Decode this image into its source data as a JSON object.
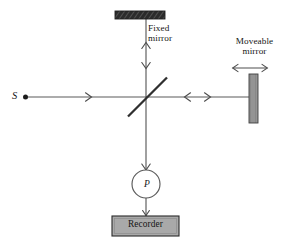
{
  "figure": {
    "kind": "michelson-interferometer-optical-diagram",
    "width": 289,
    "height": 248,
    "background_color": "#ffffff",
    "line_color": "#5a5a5a",
    "text_color": "#161616"
  },
  "labels": {
    "fixed_mirror": "Fixed\nmirror",
    "fixed_mirror_line1": "Fixed",
    "fixed_mirror_line2": "mirror",
    "moveable_mirror": "Moveable\nmirror",
    "moveable_mirror_line1": "Moveable",
    "moveable_mirror_line2": "mirror",
    "source": "S",
    "detector": "P",
    "recorder": "Recorder"
  },
  "components": [
    {
      "name": "fixed-mirror",
      "label": "Fixed mirror",
      "shape": "horizontal-bar",
      "fill": "#2e2e2e",
      "x": 115,
      "y": 11,
      "width": 50,
      "height": 8
    },
    {
      "name": "moveable-mirror",
      "label": "Moveable mirror",
      "shape": "vertical-bar",
      "fill": "#8a8a8a",
      "x": 249,
      "y": 74,
      "width": 9,
      "height": 49
    },
    {
      "name": "beam-splitter",
      "label": "",
      "shape": "diagonal-line",
      "fill": "#3a3a3a",
      "x1": 128,
      "y1": 116,
      "x2": 167,
      "y2": 78
    },
    {
      "name": "source-point",
      "label": "S",
      "shape": "dot",
      "fill": "#1c1c1c",
      "cx": 25,
      "cy": 97,
      "r": 2.4
    },
    {
      "name": "detector",
      "label": "P",
      "shape": "circle",
      "fill": "#ffffff",
      "cx": 146,
      "cy": 184,
      "r": 14
    },
    {
      "name": "recorder",
      "label": "Recorder",
      "shape": "rectangle",
      "fill": "#a8a8a8",
      "x": 112,
      "y": 216,
      "width": 67,
      "height": 20
    }
  ],
  "beams": [
    {
      "name": "source-to-splitter-beam",
      "from": "source",
      "to": "beam-splitter",
      "orientation": "horizontal",
      "x1": 28,
      "y1": 97,
      "x2": 146,
      "y2": 97,
      "arrows": [
        "right@90"
      ]
    },
    {
      "name": "splitter-to-moveable-mirror-beam",
      "from": "beam-splitter",
      "to": "moveable-mirror",
      "orientation": "horizontal",
      "x1": 146,
      "y1": 97,
      "x2": 250,
      "y2": 97,
      "arrows": [
        "left@186",
        "right@209"
      ]
    },
    {
      "name": "splitter-to-fixed-mirror-beam",
      "from": "beam-splitter",
      "to": "fixed-mirror",
      "orientation": "vertical",
      "x1": 146,
      "y1": 97,
      "x2": 146,
      "y2": 19,
      "arrows": [
        "up@43",
        "down@68"
      ]
    },
    {
      "name": "splitter-to-detector-beam",
      "from": "beam-splitter",
      "to": "detector",
      "orientation": "vertical",
      "x1": 146,
      "y1": 97,
      "x2": 146,
      "y2": 170,
      "arrows": [
        "down@168"
      ]
    },
    {
      "name": "detector-to-recorder-beam",
      "from": "detector",
      "to": "recorder",
      "orientation": "vertical",
      "x1": 146,
      "y1": 198,
      "x2": 146,
      "y2": 216,
      "arrows": [
        "down@214"
      ]
    }
  ],
  "annotations": [
    {
      "name": "moveable-mirror-motion-arrow",
      "type": "double-headed-arrow",
      "orientation": "horizontal",
      "x1": 232,
      "x2": 268,
      "y": 68
    }
  ]
}
